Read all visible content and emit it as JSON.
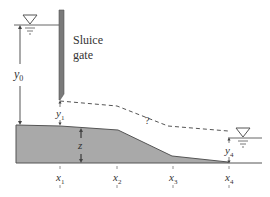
{
  "diagram": {
    "gate_label_line1": "Sluice",
    "gate_label_line2": "gate",
    "unknown_marker": "?",
    "depth_labels": {
      "y0": {
        "base": "y",
        "sub": "0"
      },
      "y1": {
        "base": "y",
        "sub": "1"
      },
      "y4": {
        "base": "y",
        "sub": "4"
      },
      "z": "z"
    },
    "stations": [
      {
        "base": "x",
        "sub": "1"
      },
      {
        "base": "x",
        "sub": "2"
      },
      {
        "base": "x",
        "sub": "3"
      },
      {
        "base": "x",
        "sub": "4"
      }
    ],
    "colors": {
      "bed_fill": "#a9a9a9",
      "line": "#555555",
      "gate": "#7a7a7a",
      "text": "#333333"
    }
  }
}
